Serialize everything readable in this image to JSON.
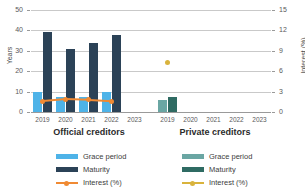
{
  "chart_data": {
    "type": "bar",
    "title": "",
    "panels": [
      {
        "name": "official",
        "title": "Official creditors",
        "categories": [
          "2019",
          "2020",
          "2021",
          "2022",
          "2023"
        ],
        "series": [
          {
            "name": "Grace period",
            "key": "grace",
            "axis": "left",
            "unit": "years",
            "color": "#4eb3e8",
            "values": [
              9.6,
              7.6,
              7.4,
              9.7,
              null
            ]
          },
          {
            "name": "Maturity",
            "key": "maturity",
            "axis": "left",
            "unit": "years",
            "color": "#2b4257",
            "values": [
              39.4,
              30.8,
              33.9,
              37.9,
              null
            ]
          },
          {
            "name": "Interest (%)",
            "key": "interest",
            "axis": "right",
            "unit": "percent",
            "color": "#f08a33",
            "values": [
              1.6,
              1.9,
              1.8,
              1.6,
              null
            ]
          }
        ]
      },
      {
        "name": "private",
        "title": "Private creditors",
        "categories": [
          "2019",
          "2020",
          "2021",
          "2022",
          "2023"
        ],
        "series": [
          {
            "name": "Grace period",
            "key": "grace",
            "axis": "left",
            "unit": "years",
            "color": "#6aa6a3",
            "values": [
              5.8,
              null,
              null,
              null,
              null
            ]
          },
          {
            "name": "Maturity",
            "key": "maturity",
            "axis": "left",
            "unit": "years",
            "color": "#2f6b63",
            "values": [
              7.2,
              null,
              null,
              null,
              null
            ]
          },
          {
            "name": "Interest (%)",
            "key": "interest",
            "axis": "right",
            "unit": "percent",
            "color": "#d9b33c",
            "values": [
              7.3,
              null,
              null,
              null,
              null
            ]
          }
        ]
      }
    ],
    "left_axis": {
      "label": "Years",
      "ticks": [
        0,
        10,
        20,
        30,
        40,
        50
      ],
      "ylim": [
        0,
        50
      ]
    },
    "right_axis": {
      "label": "Interest (%)",
      "ticks": [
        0,
        3,
        6,
        9,
        12,
        15
      ],
      "ylim": [
        0,
        15
      ]
    },
    "grid": true,
    "legend_position": "bottom"
  },
  "left_axis": {
    "label": "Years",
    "ticks": [
      "50",
      "40",
      "30",
      "20",
      "10",
      "0"
    ]
  },
  "right_axis": {
    "label": "Interest (%)",
    "ticks": [
      "15",
      "12",
      "9",
      "6",
      "3",
      "0"
    ]
  },
  "panels": {
    "official": {
      "title": "Official creditors",
      "xticks": [
        "2019",
        "2020",
        "2021",
        "2022",
        "2023"
      ]
    },
    "private": {
      "title": "Private creditors",
      "xticks": [
        "2019",
        "2020",
        "2021",
        "2022",
        "2023"
      ]
    }
  },
  "legend": {
    "official": [
      {
        "label": "Grace period",
        "color": "#4eb3e8",
        "marker": "bar"
      },
      {
        "label": "Maturity",
        "color": "#2b4257",
        "marker": "bar"
      },
      {
        "label": "Interest (%)",
        "color": "#f08a33",
        "marker": "line"
      }
    ],
    "private": [
      {
        "label": "Grace period",
        "color": "#6aa6a3",
        "marker": "bar"
      },
      {
        "label": "Maturity",
        "color": "#2f6b63",
        "marker": "bar"
      },
      {
        "label": "Interest (%)",
        "color": "#d9b33c",
        "marker": "line"
      }
    ]
  },
  "colors": {
    "grid": "#c9c9c9",
    "axis": "#9a9a9a",
    "text": "#3d3d3d"
  }
}
